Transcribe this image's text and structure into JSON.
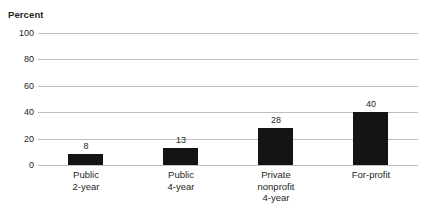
{
  "chart_data": {
    "type": "bar",
    "title": "",
    "ylabel": "Percent",
    "xlabel": "",
    "categories": [
      "Public 2-year",
      "Public 4-year",
      "Private nonprofit 4-year",
      "For-profit"
    ],
    "category_lines": [
      [
        "Public",
        "2-year"
      ],
      [
        "Public",
        "4-year"
      ],
      [
        "Private",
        "nonprofit",
        "4-year"
      ],
      [
        "For-profit"
      ]
    ],
    "values": [
      8,
      13,
      28,
      40
    ],
    "value_labels": [
      "8",
      "13",
      "28",
      "40"
    ],
    "ylim": [
      0,
      100
    ],
    "yticks": [
      100,
      80,
      60,
      40,
      20,
      0
    ],
    "ytick_labels": [
      "100",
      "80",
      "60",
      "40",
      "20",
      "0"
    ],
    "grid": true,
    "legend": false,
    "legend_position": "none",
    "bar_color": "#141414",
    "grid_color": "#bcbec0",
    "text_color": "#231f20",
    "background_color": "#ffffff"
  }
}
